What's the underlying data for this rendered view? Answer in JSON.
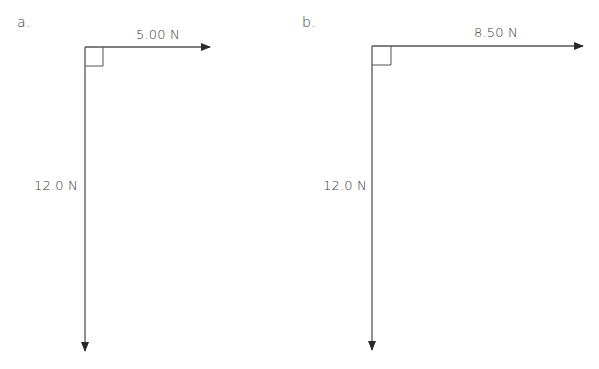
{
  "diagrams": [
    {
      "label": "a.",
      "horizontal_force": "5.00 N",
      "vertical_force": "12.0 N"
    },
    {
      "label": "b.",
      "horizontal_force": "8.50 N",
      "vertical_force": "12.0 N"
    }
  ],
  "colors": {
    "line": "#444444",
    "text": "#3a3a3a"
  }
}
